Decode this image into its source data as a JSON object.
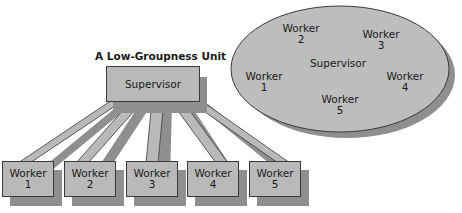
{
  "low_groupness": {
    "title": "A Low-Groupness Unit",
    "supervisor": "Supervisor",
    "workers": [
      {
        "label": "Worker",
        "num": "1"
      },
      {
        "label": "Worker",
        "num": "2"
      },
      {
        "label": "Worker",
        "num": "3"
      },
      {
        "label": "Worker",
        "num": "4"
      },
      {
        "label": "Worker",
        "num": "5"
      }
    ]
  },
  "high_groupness": {
    "supervisor": "Supervisor",
    "workers": [
      {
        "label": "Worker",
        "num": "1"
      },
      {
        "label": "Worker",
        "num": "2"
      },
      {
        "label": "Worker",
        "num": "3"
      },
      {
        "label": "Worker",
        "num": "4"
      },
      {
        "label": "Worker",
        "num": "5"
      }
    ]
  },
  "colors": {
    "fill": "#b9b9b9",
    "shadow": "#8f8f8f",
    "stroke": "#3a3a3a"
  }
}
